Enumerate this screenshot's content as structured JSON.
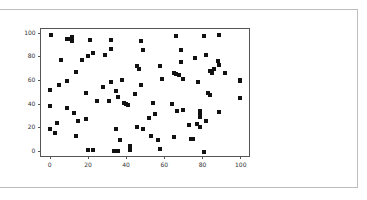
{
  "chart_data": {
    "type": "scatter",
    "title": "",
    "xlabel": "",
    "ylabel": "",
    "xlim": [
      -5,
      105
    ],
    "ylim": [
      -5,
      104
    ],
    "grid": false,
    "legend": null,
    "marker": "square",
    "marker_color": "#111111",
    "x_ticks": [
      0,
      20,
      40,
      60,
      80,
      100
    ],
    "y_ticks": [
      0,
      20,
      40,
      60,
      80,
      100
    ],
    "x_tick_labels": [
      "0",
      "20",
      "40",
      "60",
      "80",
      "100"
    ],
    "y_tick_labels": [
      "0",
      "20",
      "40",
      "60",
      "80",
      "100"
    ],
    "points": [
      [
        1,
        98
      ],
      [
        9,
        95
      ],
      [
        11,
        95
      ],
      [
        12,
        96
      ],
      [
        12,
        93
      ],
      [
        21,
        94
      ],
      [
        32,
        94
      ],
      [
        48,
        93
      ],
      [
        66,
        97
      ],
      [
        81,
        97
      ],
      [
        89,
        98
      ],
      [
        32,
        86
      ],
      [
        49,
        85
      ],
      [
        69,
        85
      ],
      [
        6,
        77
      ],
      [
        17,
        77
      ],
      [
        20,
        80
      ],
      [
        23,
        83
      ],
      [
        29,
        81
      ],
      [
        76,
        79
      ],
      [
        82,
        81
      ],
      [
        88,
        76
      ],
      [
        89,
        73
      ],
      [
        69,
        75
      ],
      [
        46,
        72
      ],
      [
        47,
        69
      ],
      [
        58,
        72
      ],
      [
        14,
        67
      ],
      [
        84,
        68
      ],
      [
        85,
        66
      ],
      [
        86,
        69
      ],
      [
        92,
        66
      ],
      [
        65,
        66
      ],
      [
        66,
        65
      ],
      [
        68,
        64
      ],
      [
        70,
        61
      ],
      [
        59,
        61
      ],
      [
        5,
        56
      ],
      [
        9,
        59
      ],
      [
        0,
        52
      ],
      [
        32,
        58
      ],
      [
        38,
        60
      ],
      [
        28,
        54
      ],
      [
        19,
        49
      ],
      [
        35,
        51
      ],
      [
        48,
        56
      ],
      [
        78,
        58
      ],
      [
        100,
        60
      ],
      [
        100,
        59
      ],
      [
        25,
        42
      ],
      [
        31,
        42
      ],
      [
        36,
        46
      ],
      [
        39,
        41
      ],
      [
        40,
        40
      ],
      [
        41,
        39
      ],
      [
        45,
        48
      ],
      [
        54,
        41
      ],
      [
        83,
        49
      ],
      [
        84,
        47
      ],
      [
        100,
        45
      ],
      [
        0,
        38
      ],
      [
        9,
        36
      ],
      [
        13,
        32
      ],
      [
        15,
        25
      ],
      [
        19,
        27
      ],
      [
        52,
        28
      ],
      [
        55,
        31
      ],
      [
        64,
        40
      ],
      [
        67,
        34
      ],
      [
        70,
        35
      ],
      [
        79,
        34
      ],
      [
        79,
        32
      ],
      [
        79,
        29
      ],
      [
        89,
        33
      ],
      [
        0,
        19
      ],
      [
        4,
        24
      ],
      [
        3,
        15
      ],
      [
        14,
        13
      ],
      [
        35,
        19
      ],
      [
        46,
        20
      ],
      [
        49,
        19
      ],
      [
        53,
        13
      ],
      [
        57,
        9
      ],
      [
        65,
        12
      ],
      [
        73,
        22
      ],
      [
        77,
        23
      ],
      [
        79,
        20
      ],
      [
        82,
        25
      ],
      [
        74,
        10
      ],
      [
        75,
        10
      ],
      [
        37,
        9
      ],
      [
        20,
        1
      ],
      [
        23,
        1
      ],
      [
        34,
        0
      ],
      [
        36,
        0
      ],
      [
        42,
        4
      ],
      [
        42,
        1
      ],
      [
        58,
        2
      ],
      [
        81,
        -1
      ]
    ]
  }
}
